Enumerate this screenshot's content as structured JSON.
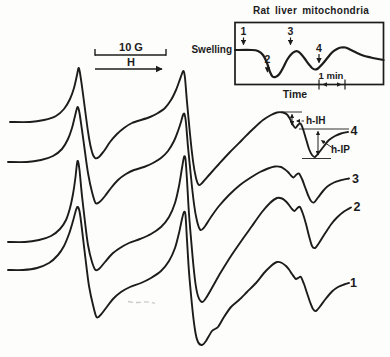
{
  "colors": {
    "ink": "#1c1c1c",
    "paper": "#fdfdfc"
  },
  "scale_bar": {
    "field_label": "10 G",
    "axis_label": "H"
  },
  "annotations": {
    "h_ih_label": "h-IH",
    "h_ip_label": "h-IP"
  },
  "main": {
    "trace_labels": [
      {
        "label": "4",
        "x": 354,
        "y": 131
      },
      {
        "label": "3",
        "x": 355.5,
        "y": 178.5
      },
      {
        "label": "2",
        "x": 357,
        "y": 207
      },
      {
        "label": "1",
        "x": 353.5,
        "y": 283
      }
    ]
  },
  "inset": {
    "title": "Rat liver mitochondria",
    "ylabel": "Swelling",
    "xlabel": "Time",
    "time_scale": "1 min",
    "markers": [
      {
        "label": "1",
        "x": 243.5,
        "label_y": 31,
        "arrow_from": 37.5,
        "arrow_to": 44.5
      },
      {
        "label": "2",
        "x": 267.5,
        "label_y": 59,
        "arrow_from": 65.5,
        "arrow_to": 72
      },
      {
        "label": "3",
        "x": 290.5,
        "label_y": 31,
        "arrow_from": 37.5,
        "arrow_to": 44.5
      },
      {
        "label": "4",
        "x": 319,
        "label_y": 48,
        "arrow_from": 54,
        "arrow_to": 62.5
      }
    ]
  },
  "chart_data": {
    "type": "line",
    "title": "Rat liver mitochondria",
    "x_axis": "Magnetic field H (scale bar = 10 G); inset x: time (scale bar = 1 min)",
    "y_axis": "EPR signal, first derivative (arb. units); inset y: swelling",
    "series": [
      {
        "name": "spectrum-4",
        "label": "4",
        "width": 1.9,
        "points": [
          [
            10,
            122
          ],
          [
            30,
            122
          ],
          [
            44,
            120
          ],
          [
            56,
            116
          ],
          [
            64,
            109
          ],
          [
            70,
            99
          ],
          [
            74,
            88
          ],
          [
            77,
            75
          ],
          [
            78.5,
            68
          ],
          [
            80,
            73
          ],
          [
            83,
            94
          ],
          [
            86,
            117
          ],
          [
            89,
            138
          ],
          [
            92,
            152
          ],
          [
            95,
            158
          ],
          [
            99,
            157
          ],
          [
            104,
            151
          ],
          [
            110,
            142
          ],
          [
            117,
            134
          ],
          [
            124,
            128
          ],
          [
            132,
            123
          ],
          [
            141,
            120
          ],
          [
            150,
            117
          ],
          [
            158,
            113
          ],
          [
            165,
            108
          ],
          [
            171,
            100
          ],
          [
            176,
            90
          ],
          [
            179,
            82
          ],
          [
            181.5,
            75
          ],
          [
            183.5,
            71
          ],
          [
            185,
            78
          ],
          [
            187,
            102
          ],
          [
            190,
            134
          ],
          [
            193,
            161
          ],
          [
            196,
            178
          ],
          [
            199,
            185
          ],
          [
            203,
            182
          ],
          [
            210,
            174
          ],
          [
            219,
            164
          ],
          [
            230,
            152
          ],
          [
            242,
            140
          ],
          [
            253,
            129
          ],
          [
            263,
            120
          ],
          [
            271,
            115
          ],
          [
            277,
            112.5
          ],
          [
            283,
            112.5
          ],
          [
            287,
            114.5
          ],
          [
            290,
            119
          ],
          [
            293,
            125
          ],
          [
            295.5,
            128
          ],
          [
            298,
            125
          ],
          [
            300.5,
            123.5
          ],
          [
            303,
            129
          ],
          [
            306,
            139
          ],
          [
            309,
            149
          ],
          [
            312,
            155
          ],
          [
            315,
            157
          ],
          [
            319,
            152.5
          ],
          [
            324,
            146
          ],
          [
            329,
            140
          ],
          [
            335,
            136
          ],
          [
            341,
            133.5
          ],
          [
            348,
            132
          ]
        ]
      },
      {
        "name": "spectrum-3",
        "label": "3",
        "width": 1.9,
        "points": [
          [
            8,
            162
          ],
          [
            27,
            162
          ],
          [
            41,
            160
          ],
          [
            53,
            156
          ],
          [
            62,
            149
          ],
          [
            68,
            139
          ],
          [
            72,
            128
          ],
          [
            75,
            116
          ],
          [
            77.5,
            107
          ],
          [
            79.5,
            113
          ],
          [
            82,
            130
          ],
          [
            85,
            152
          ],
          [
            88,
            173
          ],
          [
            92,
            192
          ],
          [
            95.5,
            203
          ],
          [
            99.5,
            202
          ],
          [
            105,
            196
          ],
          [
            111,
            188
          ],
          [
            118,
            180
          ],
          [
            126,
            174
          ],
          [
            134,
            170
          ],
          [
            144,
            167
          ],
          [
            153,
            163
          ],
          [
            161,
            158
          ],
          [
            168,
            151
          ],
          [
            174,
            141
          ],
          [
            178,
            131
          ],
          [
            181,
            122
          ],
          [
            183,
            115
          ],
          [
            184.5,
            114
          ],
          [
            186,
            123
          ],
          [
            188,
            147
          ],
          [
            191,
            177
          ],
          [
            194,
            204
          ],
          [
            197,
            221
          ],
          [
            200.5,
            230
          ],
          [
            204.5,
            227
          ],
          [
            211,
            217
          ],
          [
            219,
            206
          ],
          [
            229,
            195
          ],
          [
            240,
            185
          ],
          [
            250,
            178
          ],
          [
            260,
            172
          ],
          [
            268,
            168.5
          ],
          [
            275,
            166.5
          ],
          [
            281,
            167
          ],
          [
            285,
            169.5
          ],
          [
            288,
            172
          ],
          [
            291,
            175.5
          ],
          [
            293.5,
            177.5
          ],
          [
            296.5,
            174.5
          ],
          [
            299,
            173.5
          ],
          [
            302,
            179
          ],
          [
            305,
            187
          ],
          [
            308,
            195
          ],
          [
            311,
            201
          ],
          [
            314,
            202.5
          ],
          [
            318,
            197.5
          ],
          [
            323,
            191
          ],
          [
            328,
            186
          ],
          [
            334,
            182.5
          ],
          [
            340,
            180.5
          ],
          [
            349,
            178.5
          ]
        ]
      },
      {
        "name": "spectrum-2",
        "label": "2",
        "width": 1.9,
        "points": [
          [
            8,
            242
          ],
          [
            25,
            242
          ],
          [
            39,
            240
          ],
          [
            51,
            236
          ],
          [
            60,
            229
          ],
          [
            66,
            220
          ],
          [
            70,
            208
          ],
          [
            73,
            194
          ],
          [
            75.5,
            177
          ],
          [
            77.5,
            161
          ],
          [
            79.5,
            170
          ],
          [
            82,
            196
          ],
          [
            85,
            222
          ],
          [
            88,
            245
          ],
          [
            92,
            262
          ],
          [
            95.5,
            270
          ],
          [
            99.5,
            268.5
          ],
          [
            105,
            262
          ],
          [
            112,
            254
          ],
          [
            120,
            248
          ],
          [
            129,
            243
          ],
          [
            140,
            239
          ],
          [
            151,
            234
          ],
          [
            161,
            227
          ],
          [
            169,
            217
          ],
          [
            175,
            203
          ],
          [
            179,
            186
          ],
          [
            182,
            168
          ],
          [
            184,
            157
          ],
          [
            185.5,
            159
          ],
          [
            187,
            180
          ],
          [
            189,
            214
          ],
          [
            192,
            250
          ],
          [
            195,
            280
          ],
          [
            198,
            296
          ],
          [
            202,
            302
          ],
          [
            206,
            298
          ],
          [
            213,
            286
          ],
          [
            221,
            272
          ],
          [
            231,
            256
          ],
          [
            242,
            240
          ],
          [
            252,
            226
          ],
          [
            262,
            212
          ],
          [
            270,
            203
          ],
          [
            277,
            198
          ],
          [
            282,
            198.5
          ],
          [
            286,
            201.5
          ],
          [
            289,
            205
          ],
          [
            292,
            209
          ],
          [
            294.5,
            211
          ],
          [
            297.5,
            208
          ],
          [
            300,
            207
          ],
          [
            303,
            214
          ],
          [
            306,
            224
          ],
          [
            309,
            236
          ],
          [
            312,
            246
          ],
          [
            315,
            248
          ],
          [
            319,
            243
          ],
          [
            325,
            233.5
          ],
          [
            331,
            224.5
          ],
          [
            337,
            217.5
          ],
          [
            344,
            211.5
          ],
          [
            351,
            207.5
          ]
        ]
      },
      {
        "name": "spectrum-1",
        "label": "1",
        "width": 1.9,
        "points": [
          [
            8,
            270
          ],
          [
            23,
            270
          ],
          [
            37,
            268
          ],
          [
            49,
            263
          ],
          [
            58,
            255
          ],
          [
            64,
            246
          ],
          [
            69,
            234
          ],
          [
            73,
            221
          ],
          [
            76,
            210
          ],
          [
            78,
            207
          ],
          [
            80,
            214
          ],
          [
            83,
            238
          ],
          [
            86,
            263
          ],
          [
            89,
            286
          ],
          [
            93,
            305
          ],
          [
            96.5,
            317
          ],
          [
            100.5,
            315
          ],
          [
            106,
            308
          ],
          [
            113,
            299
          ],
          [
            121,
            292
          ],
          [
            130,
            287
          ],
          [
            141,
            283
          ],
          [
            151,
            278
          ],
          [
            161,
            271
          ],
          [
            169,
            261
          ],
          [
            175,
            248
          ],
          [
            179,
            233
          ],
          [
            182,
            219
          ],
          [
            184,
            212
          ],
          [
            185.5,
            215
          ],
          [
            187,
            240
          ],
          [
            189,
            272
          ],
          [
            192,
            305
          ],
          [
            195,
            330
          ],
          [
            198,
            342
          ],
          [
            202,
            345
          ],
          [
            206,
            341
          ],
          [
            212,
            331
          ],
          [
            218,
            327
          ],
          [
            224,
            317
          ],
          [
            231,
            307
          ],
          [
            239,
            300
          ],
          [
            247,
            292
          ],
          [
            256,
            283
          ],
          [
            264,
            273
          ],
          [
            271,
            266
          ],
          [
            277,
            262
          ],
          [
            282,
            263
          ],
          [
            286,
            266
          ],
          [
            289,
            269.5
          ],
          [
            292,
            274
          ],
          [
            294.5,
            277.5
          ],
          [
            296,
            279
          ],
          [
            299,
            277.5
          ],
          [
            301,
            277
          ],
          [
            304,
            284
          ],
          [
            307,
            293
          ],
          [
            310,
            302
          ],
          [
            313,
            309
          ],
          [
            316,
            311
          ],
          [
            320,
            306.5
          ],
          [
            326,
            298.5
          ],
          [
            332,
            291.5
          ],
          [
            338,
            287
          ],
          [
            344,
            284.5
          ],
          [
            349,
            283
          ]
        ]
      },
      {
        "name": "swelling-trace",
        "label": "swelling",
        "width": 2.2,
        "points": [
          [
            235,
            50
          ],
          [
            252,
            50
          ],
          [
            258,
            51
          ],
          [
            263,
            55
          ],
          [
            267,
            63
          ],
          [
            270,
            72
          ],
          [
            272.5,
            76.5
          ],
          [
            275.5,
            77
          ],
          [
            279,
            74.5
          ],
          [
            283,
            68
          ],
          [
            287,
            60
          ],
          [
            291,
            54.5
          ],
          [
            295,
            51.5
          ],
          [
            298,
            51.5
          ],
          [
            301,
            54
          ],
          [
            305,
            59
          ],
          [
            309,
            64.5
          ],
          [
            312,
            68
          ],
          [
            315,
            69.5
          ],
          [
            318,
            68.5
          ],
          [
            322,
            64.5
          ],
          [
            327,
            58.5
          ],
          [
            332,
            52.5
          ],
          [
            337,
            49
          ],
          [
            341,
            47.5
          ],
          [
            345.5,
            47.5
          ],
          [
            350,
            49.5
          ],
          [
            356,
            52.5
          ],
          [
            363,
            55.5
          ],
          [
            371,
            57.5
          ],
          [
            378,
            59
          ],
          [
            383.5,
            60
          ]
        ]
      }
    ]
  }
}
